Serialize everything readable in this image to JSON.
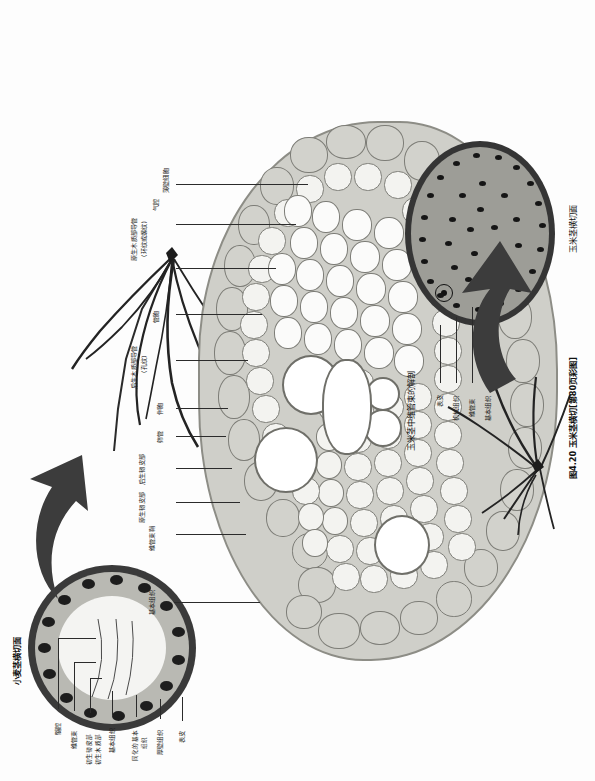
{
  "figure": {
    "caption": "图4.20 玉米茎横切[第80页彩图]",
    "inset_top_title": "小麦茎横切面",
    "inset_bottom_title": "玉米茎横切面",
    "center_title": "玉米茎中维管束的解剖"
  },
  "wheat_labels": [
    {
      "id": "pith-cavity",
      "text": "髓腔"
    },
    {
      "id": "vascular-bundle",
      "text": "维管束"
    },
    {
      "id": "protophloem",
      "text": "初生韧皮部"
    },
    {
      "id": "protoxylem",
      "text": "初生木质部"
    },
    {
      "id": "ground-tissue",
      "text": "基本组织"
    },
    {
      "id": "assimilating",
      "text": "同化的基本"
    },
    {
      "id": "assimilating2",
      "text": "组织"
    },
    {
      "id": "sclerenchyma",
      "text": "厚壁组织"
    },
    {
      "id": "epidermis",
      "text": "表皮"
    }
  ],
  "maize_labels": [
    {
      "id": "ground-tissue",
      "text": "基本组织"
    },
    {
      "id": "bundle-sheath",
      "text": "维管束鞘"
    },
    {
      "id": "protophloem",
      "text": "原生韧皮部"
    },
    {
      "id": "metaphloem",
      "text": "后生韧皮部"
    },
    {
      "id": "sieve-tube",
      "text": "筛管"
    },
    {
      "id": "companion-cell",
      "text": "伴胞"
    },
    {
      "id": "metaxylem-vessel",
      "text": "后生木质部导管"
    },
    {
      "id": "metaxylem-pitted",
      "text": "(孔纹)"
    },
    {
      "id": "tracheid",
      "text": "管胞"
    },
    {
      "id": "protoxylem-vessel",
      "text": "原生木质部导管"
    },
    {
      "id": "protoxylem-type",
      "text": "(环纹或螺纹)"
    },
    {
      "id": "air-cavity",
      "text": "气腔"
    },
    {
      "id": "parenchyma",
      "text": "薄壁细胞"
    }
  ],
  "maize_inset_labels": [
    {
      "id": "epidermis",
      "text": "表皮"
    },
    {
      "id": "sclerenchyma",
      "text": "机械组织"
    },
    {
      "id": "vascular-bundle",
      "text": "维管束"
    },
    {
      "id": "ground-tissue",
      "text": "基本组织"
    }
  ],
  "colors": {
    "ink": "#1a1a1a",
    "tissue_dark": "#3a3a3a",
    "tissue_mid": "#b9b9b3",
    "tissue_light": "#e8e8e4",
    "page": "#fdfdfd"
  }
}
